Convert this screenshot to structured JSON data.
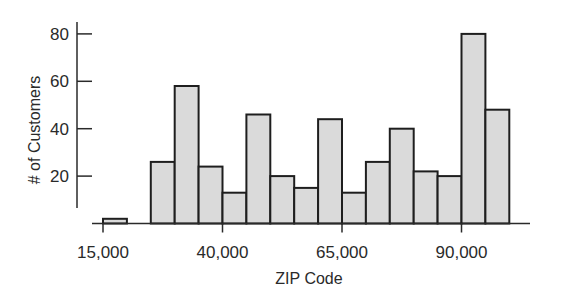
{
  "chart_data": {
    "type": "bar",
    "subtype": "histogram",
    "title": "",
    "xlabel": "ZIP Code",
    "ylabel": "# of Customers",
    "bin_width": 5000,
    "bins": [
      {
        "start": 15000,
        "end": 20000,
        "count": 2
      },
      {
        "start": 20000,
        "end": 25000,
        "count": 0
      },
      {
        "start": 25000,
        "end": 30000,
        "count": 26
      },
      {
        "start": 30000,
        "end": 35000,
        "count": 58
      },
      {
        "start": 35000,
        "end": 40000,
        "count": 24
      },
      {
        "start": 40000,
        "end": 45000,
        "count": 13
      },
      {
        "start": 45000,
        "end": 50000,
        "count": 46
      },
      {
        "start": 50000,
        "end": 55000,
        "count": 20
      },
      {
        "start": 55000,
        "end": 60000,
        "count": 15
      },
      {
        "start": 60000,
        "end": 65000,
        "count": 44
      },
      {
        "start": 65000,
        "end": 70000,
        "count": 13
      },
      {
        "start": 70000,
        "end": 75000,
        "count": 26
      },
      {
        "start": 75000,
        "end": 80000,
        "count": 40
      },
      {
        "start": 80000,
        "end": 85000,
        "count": 22
      },
      {
        "start": 85000,
        "end": 90000,
        "count": 20
      },
      {
        "start": 90000,
        "end": 95000,
        "count": 80
      },
      {
        "start": 95000,
        "end": 100000,
        "count": 48
      }
    ],
    "x_ticks": [
      15000,
      40000,
      65000,
      90000
    ],
    "x_tick_labels": [
      "15,000",
      "40,000",
      "65,000",
      "90,000"
    ],
    "y_ticks": [
      20,
      40,
      60,
      80
    ],
    "y_tick_labels": [
      "20",
      "40",
      "60",
      "80"
    ],
    "xlim": [
      15000,
      100000
    ],
    "ylim": [
      0,
      85
    ],
    "grid": false,
    "legend": null,
    "colors": {
      "bar_fill": "#dadada",
      "bar_edge": "#1e1e1e",
      "axis": "#2a2a2a"
    }
  }
}
